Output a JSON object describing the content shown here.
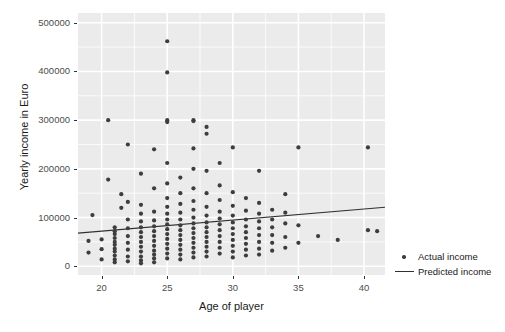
{
  "chart_data": {
    "type": "scatter",
    "title": "",
    "xlabel": "Age of player",
    "ylabel": "Yearly income in Euro",
    "xlim": [
      18.2,
      41.6
    ],
    "ylim": [
      -18000,
      520000
    ],
    "grid": true,
    "legend_position": "right",
    "x_ticks": [
      20,
      25,
      30,
      35,
      40
    ],
    "x_tick_labels": [
      "20",
      "25",
      "30",
      "35",
      "40"
    ],
    "y_ticks": [
      0,
      100000,
      200000,
      300000,
      400000,
      500000
    ],
    "y_tick_labels": [
      "0",
      "100000",
      "200000",
      "300000",
      "400000",
      "500000"
    ],
    "x_minor_ticks": [
      22.5,
      27.5,
      32.5,
      37.5
    ],
    "y_minor_ticks": [
      50000,
      150000,
      250000,
      350000,
      450000
    ],
    "panel_background": "#ebebeb",
    "gridline_color": "#ffffff",
    "point_color": "#3d3d3d",
    "line_color": "#303030",
    "series": [
      {
        "name": "Actual income",
        "marker": "dot",
        "color": "#3d3d3d",
        "points": [
          [
            19.0,
            52000
          ],
          [
            19.0,
            28000
          ],
          [
            19.3,
            105000
          ],
          [
            20.0,
            55000
          ],
          [
            20.0,
            35000
          ],
          [
            20.0,
            14000
          ],
          [
            20.5,
            300000
          ],
          [
            20.5,
            178000
          ],
          [
            21.0,
            80000
          ],
          [
            21.0,
            72000
          ],
          [
            21.0,
            66000
          ],
          [
            21.0,
            58000
          ],
          [
            21.0,
            50000
          ],
          [
            21.0,
            44000
          ],
          [
            21.0,
            36000
          ],
          [
            21.0,
            30000
          ],
          [
            21.0,
            22000
          ],
          [
            21.0,
            14000
          ],
          [
            21.0,
            8000
          ],
          [
            21.5,
            148000
          ],
          [
            21.5,
            120000
          ],
          [
            22.0,
            250000
          ],
          [
            22.0,
            132000
          ],
          [
            22.0,
            96000
          ],
          [
            22.0,
            78000
          ],
          [
            22.0,
            62000
          ],
          [
            22.0,
            48000
          ],
          [
            22.0,
            34000
          ],
          [
            22.0,
            20000
          ],
          [
            22.0,
            10000
          ],
          [
            23.0,
            190000
          ],
          [
            23.0,
            126000
          ],
          [
            23.0,
            108000
          ],
          [
            23.0,
            92000
          ],
          [
            23.0,
            80000
          ],
          [
            23.0,
            70000
          ],
          [
            23.0,
            60000
          ],
          [
            23.0,
            50000
          ],
          [
            23.0,
            40000
          ],
          [
            23.0,
            30000
          ],
          [
            23.0,
            20000
          ],
          [
            23.0,
            12000
          ],
          [
            23.0,
            6000
          ],
          [
            24.0,
            240000
          ],
          [
            24.0,
            160000
          ],
          [
            24.0,
            112000
          ],
          [
            24.0,
            94000
          ],
          [
            24.0,
            82000
          ],
          [
            24.0,
            72000
          ],
          [
            24.0,
            62000
          ],
          [
            24.0,
            52000
          ],
          [
            24.0,
            42000
          ],
          [
            24.0,
            32000
          ],
          [
            24.0,
            24000
          ],
          [
            24.0,
            16000
          ],
          [
            24.0,
            8000
          ],
          [
            25.0,
            462000
          ],
          [
            25.0,
            398000
          ],
          [
            25.0,
            300000
          ],
          [
            25.0,
            296000
          ],
          [
            25.0,
            212000
          ],
          [
            25.0,
            170000
          ],
          [
            25.0,
            140000
          ],
          [
            25.0,
            122000
          ],
          [
            25.0,
            108000
          ],
          [
            25.0,
            96000
          ],
          [
            25.0,
            86000
          ],
          [
            25.0,
            76000
          ],
          [
            25.0,
            66000
          ],
          [
            25.0,
            56000
          ],
          [
            25.0,
            46000
          ],
          [
            25.0,
            36000
          ],
          [
            25.0,
            26000
          ],
          [
            25.0,
            16000
          ],
          [
            26.0,
            182000
          ],
          [
            26.0,
            150000
          ],
          [
            26.0,
            128000
          ],
          [
            26.0,
            110000
          ],
          [
            26.0,
            96000
          ],
          [
            26.0,
            84000
          ],
          [
            26.0,
            74000
          ],
          [
            26.0,
            64000
          ],
          [
            26.0,
            54000
          ],
          [
            26.0,
            44000
          ],
          [
            26.0,
            34000
          ],
          [
            26.0,
            24000
          ],
          [
            26.0,
            14000
          ],
          [
            27.0,
            300000
          ],
          [
            27.0,
            298000
          ],
          [
            27.0,
            242000
          ],
          [
            27.0,
            200000
          ],
          [
            27.0,
            160000
          ],
          [
            27.0,
            134000
          ],
          [
            27.0,
            116000
          ],
          [
            27.0,
            100000
          ],
          [
            27.0,
            88000
          ],
          [
            27.0,
            78000
          ],
          [
            27.0,
            68000
          ],
          [
            27.0,
            58000
          ],
          [
            27.0,
            48000
          ],
          [
            27.0,
            38000
          ],
          [
            27.0,
            28000
          ],
          [
            27.0,
            18000
          ],
          [
            28.0,
            286000
          ],
          [
            28.0,
            272000
          ],
          [
            28.0,
            196000
          ],
          [
            28.0,
            150000
          ],
          [
            28.0,
            122000
          ],
          [
            28.0,
            104000
          ],
          [
            28.0,
            90000
          ],
          [
            28.0,
            80000
          ],
          [
            28.0,
            70000
          ],
          [
            28.0,
            60000
          ],
          [
            28.0,
            50000
          ],
          [
            28.0,
            40000
          ],
          [
            28.0,
            30000
          ],
          [
            28.0,
            20000
          ],
          [
            29.0,
            212000
          ],
          [
            29.0,
            166000
          ],
          [
            29.0,
            136000
          ],
          [
            29.0,
            112000
          ],
          [
            29.0,
            98000
          ],
          [
            29.0,
            86000
          ],
          [
            29.0,
            74000
          ],
          [
            29.0,
            62000
          ],
          [
            29.0,
            50000
          ],
          [
            29.0,
            38000
          ],
          [
            29.0,
            26000
          ],
          [
            30.0,
            244000
          ],
          [
            30.0,
            152000
          ],
          [
            30.0,
            124000
          ],
          [
            30.0,
            104000
          ],
          [
            30.0,
            90000
          ],
          [
            30.0,
            78000
          ],
          [
            30.0,
            66000
          ],
          [
            30.0,
            54000
          ],
          [
            30.0,
            42000
          ],
          [
            30.0,
            30000
          ],
          [
            30.0,
            18000
          ],
          [
            31.0,
            140000
          ],
          [
            31.0,
            114000
          ],
          [
            31.0,
            96000
          ],
          [
            31.0,
            82000
          ],
          [
            31.0,
            70000
          ],
          [
            31.0,
            58000
          ],
          [
            31.0,
            46000
          ],
          [
            31.0,
            34000
          ],
          [
            31.0,
            22000
          ],
          [
            32.0,
            196000
          ],
          [
            32.0,
            130000
          ],
          [
            32.0,
            108000
          ],
          [
            32.0,
            92000
          ],
          [
            32.0,
            78000
          ],
          [
            32.0,
            64000
          ],
          [
            32.0,
            50000
          ],
          [
            32.0,
            36000
          ],
          [
            32.0,
            24000
          ],
          [
            33.0,
            116000
          ],
          [
            33.0,
            96000
          ],
          [
            33.0,
            80000
          ],
          [
            33.0,
            64000
          ],
          [
            33.0,
            48000
          ],
          [
            33.0,
            32000
          ],
          [
            34.0,
            148000
          ],
          [
            34.0,
            110000
          ],
          [
            34.0,
            88000
          ],
          [
            34.0,
            60000
          ],
          [
            34.0,
            38000
          ],
          [
            35.0,
            244000
          ],
          [
            35.0,
            84000
          ],
          [
            35.0,
            48000
          ],
          [
            36.5,
            62000
          ],
          [
            38.0,
            54000
          ],
          [
            40.3,
            244000
          ],
          [
            40.3,
            74000
          ],
          [
            41.0,
            72000
          ]
        ]
      },
      {
        "name": "Predicted income",
        "marker": "line",
        "color": "#303030",
        "line": [
          [
            18.2,
            68000
          ],
          [
            41.6,
            121000
          ]
        ]
      }
    ]
  },
  "legend": {
    "items": [
      {
        "label": "Actual income",
        "marker": "dot"
      },
      {
        "label": "Predicted income",
        "marker": "line"
      }
    ]
  }
}
